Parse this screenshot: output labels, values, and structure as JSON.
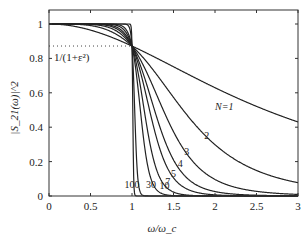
{
  "chart_data": {
    "type": "line",
    "title": "",
    "xlabel": "ω/ω_c",
    "ylabel": "|S_21(ω)|^2",
    "xlim": [
      0,
      3
    ],
    "ylim": [
      0,
      1.07
    ],
    "grid": false,
    "x_ticks": [
      "0",
      "0.5",
      "1",
      "1.5",
      "2",
      "2.5",
      "3"
    ],
    "y_ticks": [
      "0",
      "0.2",
      "0.4",
      "0.6",
      "0.8",
      "1"
    ],
    "ripple_level": 0.872,
    "ripple_label": "1/(1+ε²)",
    "formula": "1/(1+eps2*x^(2N))",
    "eps2": 0.147,
    "series": [
      {
        "name": "N=1",
        "N": 1,
        "label": "N=1",
        "label_x": 2.0,
        "label_y": 0.5
      },
      {
        "name": "N=2",
        "N": 2,
        "label": "2",
        "label_x": 1.87,
        "label_y": 0.33
      },
      {
        "name": "N=3",
        "N": 3,
        "label": "3",
        "label_x": 1.63,
        "label_y": 0.24
      },
      {
        "name": "N=4",
        "N": 4,
        "label": "4",
        "label_x": 1.55,
        "label_y": 0.17
      },
      {
        "name": "N=5",
        "N": 5,
        "label": "5",
        "label_x": 1.47,
        "label_y": 0.11
      },
      {
        "name": "N=7",
        "N": 7,
        "label": "7",
        "label_x": 1.4,
        "label_y": 0.065
      },
      {
        "name": "N=10",
        "N": 10,
        "label": "10",
        "label_x": 1.33,
        "label_y": 0.04
      },
      {
        "name": "N=30",
        "N": 30,
        "label": "30",
        "label_x": 1.17,
        "label_y": 0.045
      },
      {
        "name": "N=100",
        "N": 100,
        "label": "100",
        "label_x": 0.91,
        "label_y": 0.045
      }
    ]
  }
}
